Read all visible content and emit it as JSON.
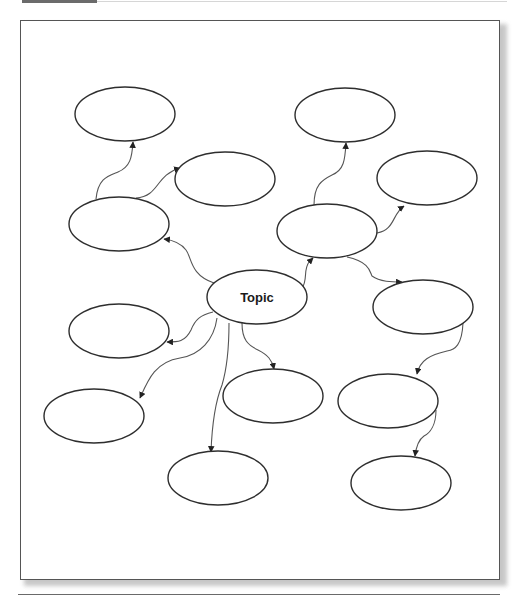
{
  "figure": {
    "label_visible": false
  },
  "diagram": {
    "type": "concept-map",
    "central_node": {
      "id": "topic",
      "label": "Topic",
      "cx": 257,
      "cy": 297,
      "rx": 50,
      "ry": 27
    },
    "nodes": [
      {
        "id": "n1",
        "label": "",
        "cx": 125,
        "cy": 114,
        "rx": 50,
        "ry": 27
      },
      {
        "id": "n2",
        "label": "",
        "cx": 225,
        "cy": 179,
        "rx": 50,
        "ry": 27
      },
      {
        "id": "n3",
        "label": "",
        "cx": 119,
        "cy": 224,
        "rx": 50,
        "ry": 27
      },
      {
        "id": "n4",
        "label": "",
        "cx": 345,
        "cy": 115,
        "rx": 50,
        "ry": 27
      },
      {
        "id": "n5",
        "label": "",
        "cx": 427,
        "cy": 178,
        "rx": 50,
        "ry": 27
      },
      {
        "id": "n6",
        "label": "",
        "cx": 327,
        "cy": 231,
        "rx": 50,
        "ry": 27
      },
      {
        "id": "n7",
        "label": "",
        "cx": 423,
        "cy": 307,
        "rx": 50,
        "ry": 27
      },
      {
        "id": "n8",
        "label": "",
        "cx": 119,
        "cy": 331,
        "rx": 50,
        "ry": 27
      },
      {
        "id": "n9",
        "label": "",
        "cx": 94,
        "cy": 416,
        "rx": 50,
        "ry": 27
      },
      {
        "id": "n10",
        "label": "",
        "cx": 273,
        "cy": 396,
        "rx": 50,
        "ry": 27
      },
      {
        "id": "n11",
        "label": "",
        "cx": 218,
        "cy": 478,
        "rx": 50,
        "ry": 27
      },
      {
        "id": "n12",
        "label": "",
        "cx": 388,
        "cy": 401,
        "rx": 50,
        "ry": 27
      },
      {
        "id": "n13",
        "label": "",
        "cx": 401,
        "cy": 483,
        "rx": 50,
        "ry": 27
      }
    ],
    "edges": [
      {
        "from": "topic",
        "to": "n3"
      },
      {
        "from": "n3",
        "to": "n1"
      },
      {
        "from": "n3",
        "to": "n2"
      },
      {
        "from": "topic",
        "to": "n6"
      },
      {
        "from": "n6",
        "to": "n4"
      },
      {
        "from": "n6",
        "to": "n5"
      },
      {
        "from": "n6",
        "to": "n7"
      },
      {
        "from": "n7",
        "to": "n12"
      },
      {
        "from": "n12",
        "to": "n13"
      },
      {
        "from": "topic",
        "to": "n8"
      },
      {
        "from": "topic",
        "to": "n9"
      },
      {
        "from": "topic",
        "to": "n11"
      },
      {
        "from": "topic",
        "to": "n10"
      }
    ]
  }
}
